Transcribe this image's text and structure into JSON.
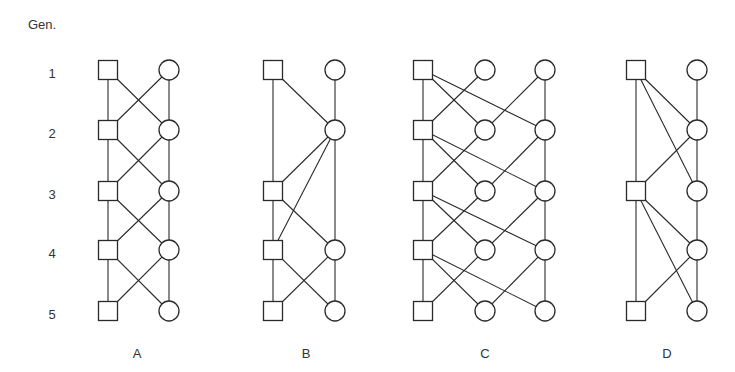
{
  "header": {
    "gen_label": "Gen."
  },
  "generations": [
    "1",
    "2",
    "3",
    "4",
    "5"
  ],
  "layout": {
    "row_y": [
      70,
      130,
      191,
      250,
      311
    ],
    "square_size": 19,
    "circle_r": 10,
    "gen_label_x": 52,
    "panel_label_y": 353
  },
  "diagrams": [
    {
      "id": "A",
      "label": "A",
      "label_x": 137,
      "columns": {
        "sq": 108,
        "c": 169
      },
      "nodes": [
        {
          "id": "s1",
          "type": "square",
          "col": "sq",
          "row": 0
        },
        {
          "id": "s2",
          "type": "square",
          "col": "sq",
          "row": 1
        },
        {
          "id": "s3",
          "type": "square",
          "col": "sq",
          "row": 2
        },
        {
          "id": "s4",
          "type": "square",
          "col": "sq",
          "row": 3
        },
        {
          "id": "s5",
          "type": "square",
          "col": "sq",
          "row": 4
        },
        {
          "id": "c1",
          "type": "circle",
          "col": "c",
          "row": 0
        },
        {
          "id": "c2",
          "type": "circle",
          "col": "c",
          "row": 1
        },
        {
          "id": "c3",
          "type": "circle",
          "col": "c",
          "row": 2
        },
        {
          "id": "c4",
          "type": "circle",
          "col": "c",
          "row": 3
        },
        {
          "id": "c5",
          "type": "circle",
          "col": "c",
          "row": 4
        }
      ],
      "edges": [
        [
          "s1",
          "s2"
        ],
        [
          "s2",
          "s3"
        ],
        [
          "s3",
          "s4"
        ],
        [
          "s4",
          "s5"
        ],
        [
          "c1",
          "c2"
        ],
        [
          "c2",
          "c3"
        ],
        [
          "c3",
          "c4"
        ],
        [
          "c4",
          "c5"
        ],
        [
          "s1",
          "c2"
        ],
        [
          "c1",
          "s2"
        ],
        [
          "s2",
          "c3"
        ],
        [
          "c2",
          "s3"
        ],
        [
          "s3",
          "c4"
        ],
        [
          "c3",
          "s4"
        ],
        [
          "s4",
          "c5"
        ],
        [
          "c4",
          "s5"
        ]
      ]
    },
    {
      "id": "B",
      "label": "B",
      "label_x": 306,
      "columns": {
        "sq": 273,
        "c": 335
      },
      "nodes": [
        {
          "id": "s1",
          "type": "square",
          "col": "sq",
          "row": 0
        },
        {
          "id": "s3",
          "type": "square",
          "col": "sq",
          "row": 2
        },
        {
          "id": "s4",
          "type": "square",
          "col": "sq",
          "row": 3
        },
        {
          "id": "s5",
          "type": "square",
          "col": "sq",
          "row": 4
        },
        {
          "id": "c1",
          "type": "circle",
          "col": "c",
          "row": 0
        },
        {
          "id": "c2",
          "type": "circle",
          "col": "c",
          "row": 1
        },
        {
          "id": "c4",
          "type": "circle",
          "col": "c",
          "row": 3
        },
        {
          "id": "c5",
          "type": "circle",
          "col": "c",
          "row": 4
        }
      ],
      "edges": [
        [
          "s1",
          "s3"
        ],
        [
          "s3",
          "s4"
        ],
        [
          "s4",
          "s5"
        ],
        [
          "c1",
          "c2"
        ],
        [
          "c2",
          "c4"
        ],
        [
          "c4",
          "c5"
        ],
        [
          "s1",
          "c2"
        ],
        [
          "c2",
          "s3"
        ],
        [
          "c2",
          "s4"
        ],
        [
          "s3",
          "c4"
        ],
        [
          "s4",
          "c5"
        ],
        [
          "c4",
          "s5"
        ]
      ]
    },
    {
      "id": "C",
      "label": "C",
      "label_x": 485,
      "columns": {
        "sq": 423,
        "m": 485,
        "r": 545
      },
      "nodes": [
        {
          "id": "s1",
          "type": "square",
          "col": "sq",
          "row": 0
        },
        {
          "id": "s2",
          "type": "square",
          "col": "sq",
          "row": 1
        },
        {
          "id": "s3",
          "type": "square",
          "col": "sq",
          "row": 2
        },
        {
          "id": "s4",
          "type": "square",
          "col": "sq",
          "row": 3
        },
        {
          "id": "s5",
          "type": "square",
          "col": "sq",
          "row": 4
        },
        {
          "id": "m1",
          "type": "circle",
          "col": "m",
          "row": 0
        },
        {
          "id": "m2",
          "type": "circle",
          "col": "m",
          "row": 1
        },
        {
          "id": "m3",
          "type": "circle",
          "col": "m",
          "row": 2
        },
        {
          "id": "m4",
          "type": "circle",
          "col": "m",
          "row": 3
        },
        {
          "id": "m5",
          "type": "circle",
          "col": "m",
          "row": 4
        },
        {
          "id": "r1",
          "type": "circle",
          "col": "r",
          "row": 0
        },
        {
          "id": "r2",
          "type": "circle",
          "col": "r",
          "row": 1
        },
        {
          "id": "r3",
          "type": "circle",
          "col": "r",
          "row": 2
        },
        {
          "id": "r4",
          "type": "circle",
          "col": "r",
          "row": 3
        },
        {
          "id": "r5",
          "type": "circle",
          "col": "r",
          "row": 4
        }
      ],
      "edges": [
        [
          "s1",
          "s2"
        ],
        [
          "s2",
          "s3"
        ],
        [
          "s3",
          "s4"
        ],
        [
          "s4",
          "s5"
        ],
        [
          "r1",
          "r2"
        ],
        [
          "r2",
          "r3"
        ],
        [
          "r3",
          "r4"
        ],
        [
          "r4",
          "r5"
        ],
        [
          "s1",
          "m2"
        ],
        [
          "s1",
          "r2"
        ],
        [
          "m1",
          "s2"
        ],
        [
          "r1",
          "m2"
        ],
        [
          "s2",
          "m3"
        ],
        [
          "s2",
          "r3"
        ],
        [
          "m2",
          "s3"
        ],
        [
          "r2",
          "m3"
        ],
        [
          "s3",
          "m4"
        ],
        [
          "s3",
          "r4"
        ],
        [
          "m3",
          "s4"
        ],
        [
          "r3",
          "m4"
        ],
        [
          "s4",
          "m5"
        ],
        [
          "s4",
          "r5"
        ],
        [
          "m4",
          "s5"
        ],
        [
          "r4",
          "m5"
        ]
      ]
    },
    {
      "id": "D",
      "label": "D",
      "label_x": 667,
      "columns": {
        "sq": 636,
        "c": 697
      },
      "nodes": [
        {
          "id": "s1",
          "type": "square",
          "col": "sq",
          "row": 0
        },
        {
          "id": "s3",
          "type": "square",
          "col": "sq",
          "row": 2
        },
        {
          "id": "s5",
          "type": "square",
          "col": "sq",
          "row": 4
        },
        {
          "id": "c1",
          "type": "circle",
          "col": "c",
          "row": 0
        },
        {
          "id": "c2",
          "type": "circle",
          "col": "c",
          "row": 1
        },
        {
          "id": "c3",
          "type": "circle",
          "col": "c",
          "row": 2
        },
        {
          "id": "c4",
          "type": "circle",
          "col": "c",
          "row": 3
        },
        {
          "id": "c5",
          "type": "circle",
          "col": "c",
          "row": 4
        }
      ],
      "edges": [
        [
          "s1",
          "s3"
        ],
        [
          "s3",
          "s5"
        ],
        [
          "c1",
          "c2"
        ],
        [
          "c2",
          "c3"
        ],
        [
          "c3",
          "c4"
        ],
        [
          "c4",
          "c5"
        ],
        [
          "s1",
          "c2"
        ],
        [
          "s1",
          "c3"
        ],
        [
          "c2",
          "s3"
        ],
        [
          "s3",
          "c4"
        ],
        [
          "s3",
          "c5"
        ],
        [
          "c4",
          "s5"
        ]
      ]
    }
  ]
}
